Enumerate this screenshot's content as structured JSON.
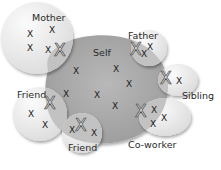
{
  "diagram": {
    "type": "social-network-circles",
    "center": {
      "label": "Self",
      "small_marks": [
        "X",
        "X",
        "X",
        "X",
        "X",
        "X",
        "X"
      ]
    },
    "circles": [
      {
        "id": "mother",
        "label": "Mother",
        "marks": [
          "X",
          "X",
          "X",
          "X"
        ],
        "big_mark": "X"
      },
      {
        "id": "father",
        "label": "Father",
        "marks": [
          "X",
          "X"
        ],
        "big_mark": "X"
      },
      {
        "id": "sibling",
        "label": "Sibling",
        "marks": [
          "X"
        ],
        "big_mark": "X"
      },
      {
        "id": "coworker",
        "label": "Co-worker",
        "marks": [
          "X",
          "X",
          "X"
        ],
        "big_mark": "X"
      },
      {
        "id": "friend1",
        "label": "Friend",
        "marks": [
          "X",
          "X"
        ],
        "big_mark": "X"
      },
      {
        "id": "friend2",
        "label": "Friend",
        "marks": [
          "X",
          "X"
        ],
        "big_mark": "X"
      }
    ],
    "colors": {
      "self_fill": "#a9a9a9",
      "circle_fill": "#ededed",
      "overlap_fill": "#c4c4c4",
      "text": "#2a2a2a"
    }
  }
}
